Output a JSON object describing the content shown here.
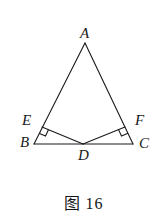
{
  "figure": {
    "caption": "图 16",
    "caption_label": "图",
    "caption_number": "16",
    "background_color": "#ffffff",
    "stroke_color": "#1a1a1a",
    "label_color": "#1a1a1a",
    "stroke_width": 1.1
  },
  "labels": {
    "A": "A",
    "B": "B",
    "C": "C",
    "D": "D",
    "E": "E",
    "F": "F"
  },
  "chart_data": {
    "type": "diagram",
    "title": "图 16",
    "points": [
      {
        "name": "A",
        "x": 85,
        "y": 43,
        "label_x": 80,
        "label_y": 26
      },
      {
        "name": "B",
        "x": 34,
        "y": 144,
        "label_x": 20,
        "label_y": 135
      },
      {
        "name": "C",
        "x": 133,
        "y": 144,
        "label_x": 139,
        "label_y": 136
      },
      {
        "name": "D",
        "x": 83,
        "y": 144,
        "label_x": 78,
        "label_y": 148
      },
      {
        "name": "E",
        "x": 42,
        "y": 127,
        "label_x": 22,
        "label_y": 113
      },
      {
        "name": "F",
        "x": 125,
        "y": 127,
        "label_x": 135,
        "label_y": 113
      }
    ],
    "segments": [
      {
        "name": "AB",
        "from": "A",
        "to": "B"
      },
      {
        "name": "AC",
        "from": "A",
        "to": "C"
      },
      {
        "name": "BC",
        "from": "B",
        "to": "C"
      },
      {
        "name": "ED",
        "from": "E",
        "to": "D"
      },
      {
        "name": "FD",
        "from": "F",
        "to": "D"
      }
    ],
    "right_angle_marks": [
      {
        "name": "right-angle-at-E",
        "vertex": "E",
        "rays": [
          "B",
          "D"
        ],
        "size": 7
      },
      {
        "name": "right-angle-at-F",
        "vertex": "F",
        "rays": [
          "C",
          "D"
        ],
        "size": 7
      }
    ]
  }
}
